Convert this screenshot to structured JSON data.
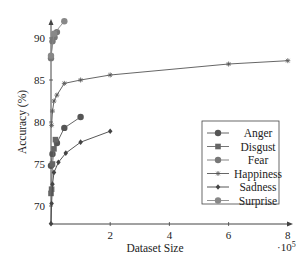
{
  "chart_data": {
    "type": "line",
    "title": "",
    "xlabel": "Dataset Size",
    "ylabel": "Accuracy (%)",
    "x_multiplier_label": "·10^5",
    "x_multiplier_base": "·10",
    "x_multiplier_exp": "5",
    "xlim": [
      0,
      8
    ],
    "ylim": [
      67.9,
      92.5
    ],
    "xticks": [
      "2",
      "4",
      "6",
      "8"
    ],
    "xtick_values": [
      2,
      4,
      6,
      8
    ],
    "yticks": [
      "70",
      "75",
      "80",
      "85",
      "90"
    ],
    "ytick_values": [
      70,
      75,
      80,
      85,
      90
    ],
    "grid": false,
    "legend_position": "center-right",
    "series": [
      {
        "name": "Anger",
        "color": "#555555",
        "marker": "circle",
        "x": [
          0.0,
          0.05,
          0.2,
          0.45,
          1.0
        ],
        "y": [
          74.8,
          76.2,
          77.5,
          79.3,
          80.6
        ]
      },
      {
        "name": "Disgust",
        "color": "#666666",
        "marker": "square",
        "x": [
          0.0,
          0.02,
          0.05,
          0.1,
          0.15
        ],
        "y": [
          71.5,
          72.0,
          75.0,
          76.8,
          77.9
        ]
      },
      {
        "name": "Fear",
        "color": "#777777",
        "marker": "circle",
        "x": [
          0.0,
          0.05,
          0.12,
          0.2
        ],
        "y": [
          87.6,
          89.6,
          90.1,
          90.7
        ]
      },
      {
        "name": "Happiness",
        "color": "#555555",
        "marker": "star",
        "x": [
          0.02,
          0.05,
          0.1,
          0.2,
          0.45,
          1.0,
          2.0,
          6.0,
          8.0
        ],
        "y": [
          79.6,
          81.3,
          82.5,
          83.2,
          84.6,
          85.0,
          85.6,
          86.9,
          87.3
        ]
      },
      {
        "name": "Sadness",
        "color": "#444444",
        "marker": "diamond",
        "x": [
          0.0,
          0.02,
          0.05,
          0.1,
          0.25,
          0.5,
          1.0,
          2.0
        ],
        "y": [
          67.9,
          70.3,
          72.6,
          74.0,
          75.2,
          76.3,
          77.6,
          78.9
        ]
      },
      {
        "name": "Surprise",
        "color": "#888888",
        "marker": "circle",
        "x": [
          0.0,
          0.1,
          0.45
        ],
        "y": [
          87.9,
          90.5,
          92.0
        ]
      }
    ]
  }
}
